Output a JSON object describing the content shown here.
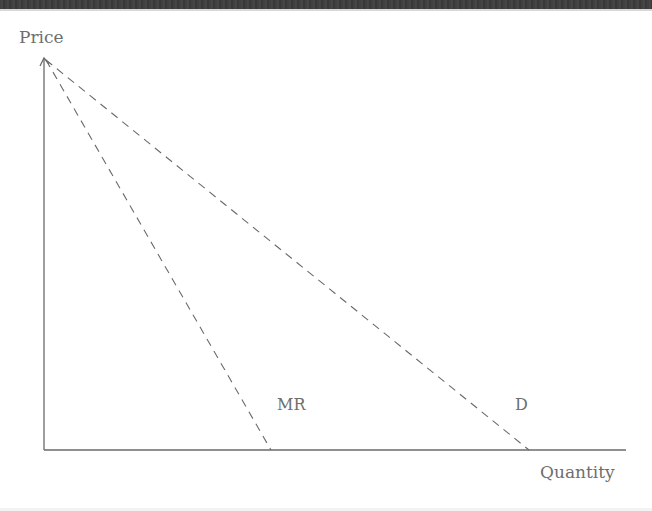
{
  "diagram": {
    "title": "",
    "y_axis_label": "Price",
    "x_axis_label": "Quantity",
    "curves": [
      {
        "name": "MR",
        "label": "MR",
        "style": "dashed",
        "from": [
          45,
          60
        ],
        "to": [
          271,
          450
        ]
      },
      {
        "name": "D",
        "label": "D",
        "style": "dashed",
        "from": [
          45,
          60
        ],
        "to": [
          529,
          450
        ]
      }
    ],
    "colors": {
      "axis": "#6a6a6a",
      "curve": "#6a6a6a",
      "label": "#6e6e6e",
      "top_band": "#3c3c3c"
    }
  }
}
